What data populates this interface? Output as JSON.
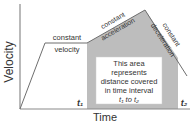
{
  "diagram": {
    "axes": {
      "y_label": "Velocity",
      "x_label": "Time"
    },
    "segments": [
      {
        "label_line1": "constant",
        "label_line2": "velocity"
      },
      {
        "label_line1": "constant",
        "label_line2": "acceleration"
      },
      {
        "label_line1": "constant",
        "label_line2": "deceleration"
      }
    ],
    "area_note": {
      "line1": "This area",
      "line2": "represents",
      "line3": "distance covered",
      "line4": "in time interval",
      "line5": "t₁ to t₂"
    },
    "markers": {
      "t1": "t₁",
      "t2": "t₂"
    },
    "colors": {
      "shaded": "#bdbdbd",
      "line": "#6e6e6e",
      "axis": "#8a8a8a",
      "box": "#ffffff"
    }
  }
}
